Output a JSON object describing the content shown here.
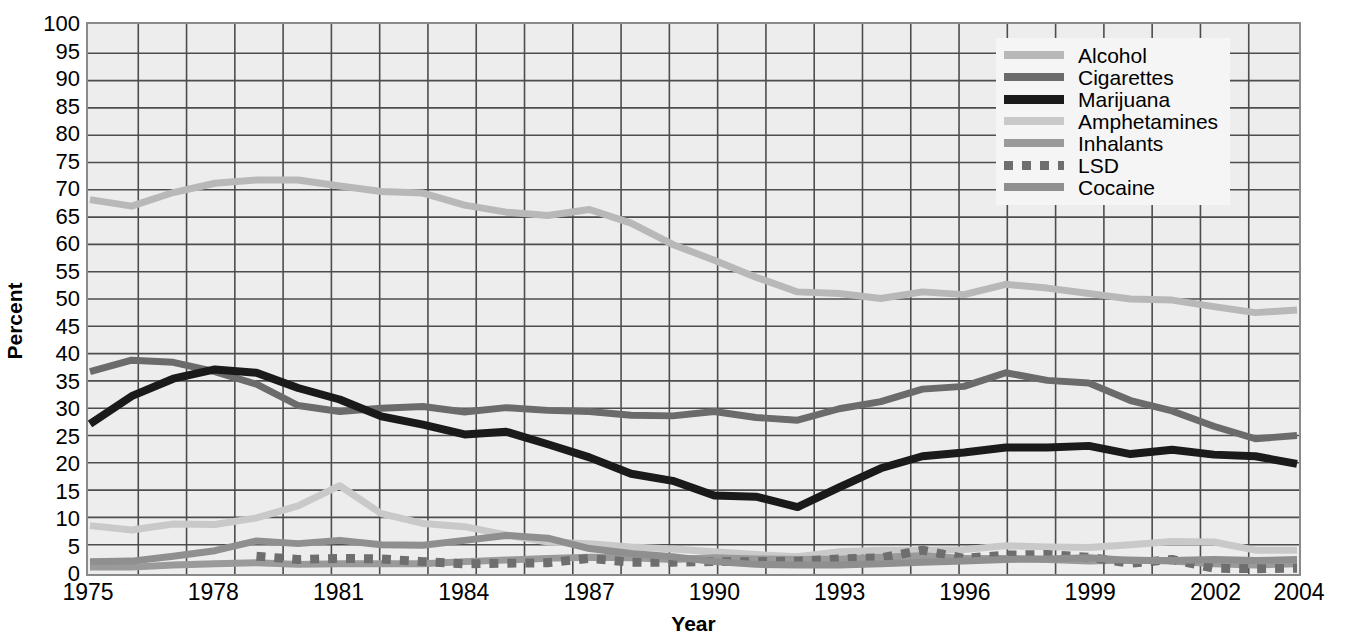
{
  "chart_data": {
    "type": "line",
    "title": "",
    "xlabel": "Year",
    "ylabel": "Percent",
    "xlim": [
      1975,
      2004
    ],
    "ylim": [
      0,
      100
    ],
    "grid": true,
    "legend_position": "top-right",
    "x": [
      1975,
      1976,
      1977,
      1978,
      1979,
      1980,
      1981,
      1982,
      1983,
      1984,
      1985,
      1986,
      1987,
      1988,
      1989,
      1990,
      1991,
      1992,
      1993,
      1994,
      1995,
      1996,
      1997,
      1998,
      1999,
      2000,
      2001,
      2002,
      2003,
      2004
    ],
    "x_tick_labels": [
      "1975",
      "1978",
      "1981",
      "1984",
      "1987",
      "1990",
      "1993",
      "1996",
      "1999",
      "2002",
      "2004"
    ],
    "y_tick_labels": [
      "100",
      "95",
      "90",
      "85",
      "80",
      "75",
      "70",
      "65",
      "60",
      "55",
      "50",
      "45",
      "40",
      "35",
      "30",
      "25",
      "20",
      "15",
      "10",
      "5",
      "0"
    ],
    "series": [
      {
        "name": "Alcohol",
        "color": "#b8b8b8",
        "style": "solid",
        "values": [
          68.2,
          67.0,
          69.5,
          71.2,
          71.8,
          71.8,
          70.7,
          69.7,
          69.4,
          67.2,
          65.9,
          65.3,
          66.4,
          63.9,
          60.0,
          57.1,
          54.0,
          51.3,
          51.0,
          50.1,
          51.3,
          50.8,
          52.7,
          52.0,
          51.0,
          50.0,
          49.8,
          48.6,
          47.5,
          48.0
        ]
      },
      {
        "name": "Cigarettes",
        "color": "#6b6b6b",
        "style": "solid",
        "values": [
          36.7,
          38.8,
          38.4,
          36.7,
          34.4,
          30.5,
          29.4,
          30.0,
          30.3,
          29.3,
          30.1,
          29.6,
          29.4,
          28.7,
          28.6,
          29.4,
          28.3,
          27.8,
          29.9,
          31.2,
          33.5,
          34.0,
          36.5,
          35.1,
          34.6,
          31.4,
          29.5,
          26.7,
          24.4,
          25.0
        ]
      },
      {
        "name": "Marijuana",
        "color": "#1a1a1a",
        "style": "solid",
        "values": [
          27.1,
          32.2,
          35.4,
          37.1,
          36.5,
          33.7,
          31.6,
          28.5,
          27.0,
          25.2,
          25.7,
          23.4,
          21.0,
          18.0,
          16.7,
          14.0,
          13.8,
          11.9,
          15.5,
          19.0,
          21.2,
          21.9,
          22.8,
          22.8,
          23.1,
          21.6,
          22.4,
          21.5,
          21.2,
          19.8
        ]
      },
      {
        "name": "Amphetamines",
        "color": "#c9c9c9",
        "style": "solid",
        "values": [
          8.5,
          7.7,
          8.8,
          8.7,
          9.9,
          12.1,
          15.8,
          10.7,
          8.9,
          8.3,
          6.8,
          5.5,
          5.2,
          4.6,
          4.2,
          3.7,
          3.2,
          2.8,
          3.7,
          4.0,
          4.0,
          4.1,
          4.8,
          4.6,
          4.5,
          5.0,
          5.6,
          5.5,
          4.0,
          4.0
        ]
      },
      {
        "name": "Inhalants",
        "color": "#9a9a9a",
        "style": "solid",
        "values": [
          0.9,
          0.9,
          1.3,
          1.5,
          1.7,
          1.4,
          1.5,
          1.5,
          1.5,
          1.9,
          2.2,
          2.5,
          2.7,
          2.6,
          2.3,
          2.6,
          2.4,
          2.3,
          2.4,
          2.7,
          3.0,
          2.5,
          2.5,
          2.3,
          2.0,
          2.2,
          2.0,
          1.5,
          1.3,
          1.5
        ]
      },
      {
        "name": "LSD",
        "color": "#6e6e6e",
        "style": "dashed",
        "values": [
          null,
          null,
          null,
          null,
          2.9,
          2.3,
          2.5,
          2.4,
          1.9,
          1.5,
          1.6,
          1.7,
          2.5,
          1.8,
          1.8,
          1.9,
          1.9,
          2.0,
          2.4,
          2.6,
          4.0,
          2.5,
          3.1,
          3.2,
          2.7,
          1.6,
          2.3,
          0.7,
          0.6,
          0.7
        ]
      },
      {
        "name": "Cocaine",
        "color": "#8f8f8f",
        "style": "solid",
        "values": [
          1.9,
          2.0,
          2.9,
          3.9,
          5.7,
          5.2,
          5.8,
          5.0,
          4.9,
          5.8,
          6.7,
          6.2,
          4.3,
          3.4,
          2.8,
          1.9,
          1.4,
          1.3,
          1.3,
          1.5,
          1.8,
          2.0,
          2.3,
          2.4,
          2.6,
          2.1,
          2.1,
          2.3,
          2.1,
          2.3
        ]
      }
    ]
  },
  "axes": {
    "y_title": "Percent",
    "x_title": "Year"
  },
  "legend": {
    "entries": [
      {
        "label": "Alcohol"
      },
      {
        "label": "Cigarettes"
      },
      {
        "label": "Marijuana"
      },
      {
        "label": "Amphetamines"
      },
      {
        "label": "Inhalants"
      },
      {
        "label": "LSD"
      },
      {
        "label": "Cocaine"
      }
    ]
  },
  "colors": {
    "plot_background": "#ededed",
    "grid": "#4d4d4d",
    "frame": "#8a8a8a",
    "page_background": "#ffffff"
  }
}
